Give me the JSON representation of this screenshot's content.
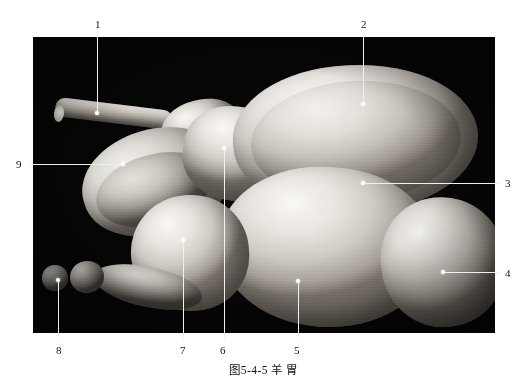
{
  "figure": {
    "caption": "图5-4-5  羊  胃",
    "caption_number": "图5-4-5",
    "caption_title": "羊  胃",
    "plate_background_color": "#050505",
    "leader_line_color": "#f0f0f0",
    "label_text_color": "#111111"
  },
  "callouts": [
    {
      "id": "1",
      "label": "1",
      "label_x": 95,
      "label_y": 19,
      "side": "top",
      "dot_x": 97,
      "dot_y": 113
    },
    {
      "id": "2",
      "label": "2",
      "label_x": 361,
      "label_y": 19,
      "side": "top",
      "dot_x": 363,
      "dot_y": 104
    },
    {
      "id": "3",
      "label": "3",
      "label_x": 505,
      "label_y": 178,
      "side": "right",
      "dot_x": 363,
      "dot_y": 183
    },
    {
      "id": "4",
      "label": "4",
      "label_x": 505,
      "label_y": 268,
      "side": "right",
      "dot_x": 443,
      "dot_y": 272
    },
    {
      "id": "5",
      "label": "5",
      "label_x": 294,
      "label_y": 345,
      "side": "bottom",
      "dot_x": 298,
      "dot_y": 281
    },
    {
      "id": "6",
      "label": "6",
      "label_x": 220,
      "label_y": 345,
      "side": "bottom",
      "dot_x": 224,
      "dot_y": 148
    },
    {
      "id": "7",
      "label": "7",
      "label_x": 180,
      "label_y": 345,
      "side": "bottom",
      "dot_x": 183,
      "dot_y": 240
    },
    {
      "id": "8",
      "label": "8",
      "label_x": 56,
      "label_y": 345,
      "side": "bottom",
      "dot_x": 58,
      "dot_y": 280
    },
    {
      "id": "9",
      "label": "9",
      "label_x": 16,
      "label_y": 159,
      "side": "left",
      "dot_x": 123,
      "dot_y": 164
    }
  ],
  "plate": {
    "left": 33,
    "top": 37,
    "width": 462,
    "height": 296,
    "subject": "sheep stomach specimen photograph"
  }
}
